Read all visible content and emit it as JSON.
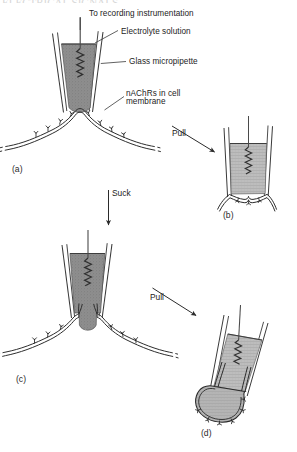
{
  "figure": {
    "title_fragment": "ELECTRICAL SIGNALS",
    "background_color": "#ffffff",
    "ink_color": "#232323",
    "fill_dark": "#8c8c8c",
    "fill_light": "#b9b9b9",
    "glass_fill": "#fdfdfd"
  },
  "callouts": [
    {
      "id": "recording",
      "text": "To recording instrumentation"
    },
    {
      "id": "electrolyte",
      "text": "Electrolyte solution"
    },
    {
      "id": "pipette",
      "text": "Glass micropipette"
    },
    {
      "id": "receptors",
      "text": "nAChRs in cell\nmembrane"
    }
  ],
  "callout_lines": {
    "recording": "To recording instrumentation",
    "electrolyte": "Electrolyte solution",
    "pipette": "Glass micropipette",
    "receptors_line1": "nAChRs in cell",
    "receptors_line2": "membrane"
  },
  "actions": [
    {
      "id": "pull-top",
      "label": "Pull",
      "direction": "down-right"
    },
    {
      "id": "suck",
      "label": "Suck",
      "direction": "down"
    },
    {
      "id": "pull-bottom",
      "label": "Pull",
      "direction": "down-right"
    }
  ],
  "action_labels": {
    "pull_top": "Pull",
    "suck": "Suck",
    "pull_bottom": "Pull"
  },
  "panels": [
    {
      "id": "a",
      "label": "(a)",
      "description": "Cell-attached patch: micropipette sealed onto intact cell membrane with nAChRs"
    },
    {
      "id": "b",
      "label": "(b)",
      "description": "Inside-out patch: membrane patch excised by pulling, cytoplasmic face outward"
    },
    {
      "id": "c",
      "label": "(c)",
      "description": "Whole-cell recording: membrane patch ruptured by suction, pipette continuous with cytoplasm"
    },
    {
      "id": "d",
      "label": "(d)",
      "description": "Outside-out patch: membrane vesicle resealed at pipette tip, extracellular face outward"
    }
  ],
  "panel_labels": {
    "a": "(a)",
    "b": "(b)",
    "c": "(c)",
    "d": "(d)"
  }
}
